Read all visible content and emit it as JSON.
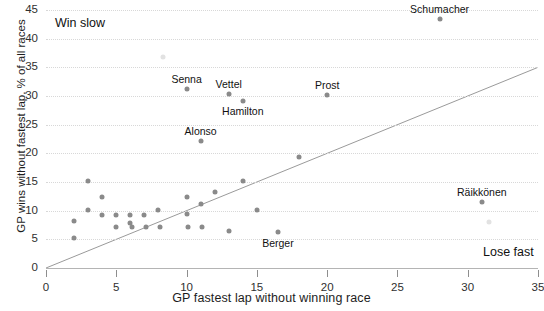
{
  "chart_data": {
    "type": "scatter",
    "title": "",
    "xlabel": "GP fastest lap without winning race",
    "ylabel": "GP wins without fastest lap, % of all races",
    "xlim": [
      0,
      35
    ],
    "ylim": [
      0,
      45
    ],
    "xticks": [
      0,
      5,
      10,
      15,
      20,
      25,
      30,
      35
    ],
    "yticks": [
      0,
      5,
      10,
      15,
      20,
      25,
      30,
      35,
      40,
      45
    ],
    "grid": true,
    "legend": "none",
    "annotations": [
      {
        "text": "Win slow",
        "position": "top-left"
      },
      {
        "text": "Lose fast",
        "position": "bottom-right"
      }
    ],
    "reference_line": {
      "type": "diagonal",
      "from": [
        0,
        0
      ],
      "to": [
        35,
        35
      ],
      "color": "#9a9a9a"
    },
    "points": [
      {
        "x": 2.0,
        "y": 8.2,
        "label": "",
        "faint": false
      },
      {
        "x": 2.0,
        "y": 5.2,
        "label": "",
        "faint": false
      },
      {
        "x": 3.0,
        "y": 15.1,
        "label": "",
        "faint": false
      },
      {
        "x": 3.0,
        "y": 10.2,
        "label": "",
        "faint": false
      },
      {
        "x": 4.0,
        "y": 12.3,
        "label": "",
        "faint": false
      },
      {
        "x": 4.0,
        "y": 9.3,
        "label": "",
        "faint": false
      },
      {
        "x": 5.0,
        "y": 9.3,
        "label": "",
        "faint": false
      },
      {
        "x": 5.0,
        "y": 7.2,
        "label": "",
        "faint": false
      },
      {
        "x": 6.0,
        "y": 9.3,
        "label": "",
        "faint": false
      },
      {
        "x": 6.0,
        "y": 7.9,
        "label": "",
        "faint": false
      },
      {
        "x": 6.1,
        "y": 7.1,
        "label": "",
        "faint": false
      },
      {
        "x": 7.0,
        "y": 9.3,
        "label": "",
        "faint": false
      },
      {
        "x": 7.1,
        "y": 7.2,
        "label": "",
        "faint": false
      },
      {
        "x": 8.3,
        "y": 36.8,
        "label": "",
        "faint": true
      },
      {
        "x": 8.0,
        "y": 10.2,
        "label": "",
        "faint": false
      },
      {
        "x": 8.1,
        "y": 7.2,
        "label": "",
        "faint": false
      },
      {
        "x": 10.0,
        "y": 31.2,
        "label": "Senna",
        "faint": false
      },
      {
        "x": 10.0,
        "y": 12.3,
        "label": "",
        "faint": false
      },
      {
        "x": 10.0,
        "y": 9.4,
        "label": "",
        "faint": false
      },
      {
        "x": 10.1,
        "y": 7.2,
        "label": "",
        "faint": false
      },
      {
        "x": 11.0,
        "y": 22.2,
        "label": "Alonso",
        "faint": false
      },
      {
        "x": 11.0,
        "y": 11.2,
        "label": "",
        "faint": false
      },
      {
        "x": 11.1,
        "y": 7.2,
        "label": "",
        "faint": false
      },
      {
        "x": 12.0,
        "y": 13.3,
        "label": "",
        "faint": false
      },
      {
        "x": 13.0,
        "y": 30.3,
        "label": "Vettel",
        "faint": false
      },
      {
        "x": 13.0,
        "y": 6.4,
        "label": "",
        "faint": false
      },
      {
        "x": 14.0,
        "y": 29.2,
        "label": "Hamilton",
        "faint": false
      },
      {
        "x": 14.0,
        "y": 15.1,
        "label": "",
        "faint": false
      },
      {
        "x": 15.0,
        "y": 10.2,
        "label": "",
        "faint": false
      },
      {
        "x": 16.5,
        "y": 6.3,
        "label": "Berger",
        "faint": false
      },
      {
        "x": 18.0,
        "y": 19.3,
        "label": "",
        "faint": false
      },
      {
        "x": 20.0,
        "y": 30.2,
        "label": "Prost",
        "faint": false
      },
      {
        "x": 28.0,
        "y": 43.5,
        "label": "Schumacher",
        "faint": false
      },
      {
        "x": 31.0,
        "y": 11.5,
        "label": "Räikkönen",
        "faint": false
      },
      {
        "x": 31.5,
        "y": 8.0,
        "label": "",
        "faint": true
      }
    ]
  },
  "axes": {
    "x_title": "GP fastest lap without winning race",
    "y_title": "GP wins without fastest lap, % of all races"
  },
  "notes": {
    "top_left": "Win slow",
    "bottom_right": "Lose fast"
  },
  "colors": {
    "dot": "#8a8a8a",
    "dot_faint": "#e2e2e2",
    "grid": "#d8d8d8",
    "line": "#9a9a9a",
    "text": "#111111",
    "background": "#ffffff"
  }
}
